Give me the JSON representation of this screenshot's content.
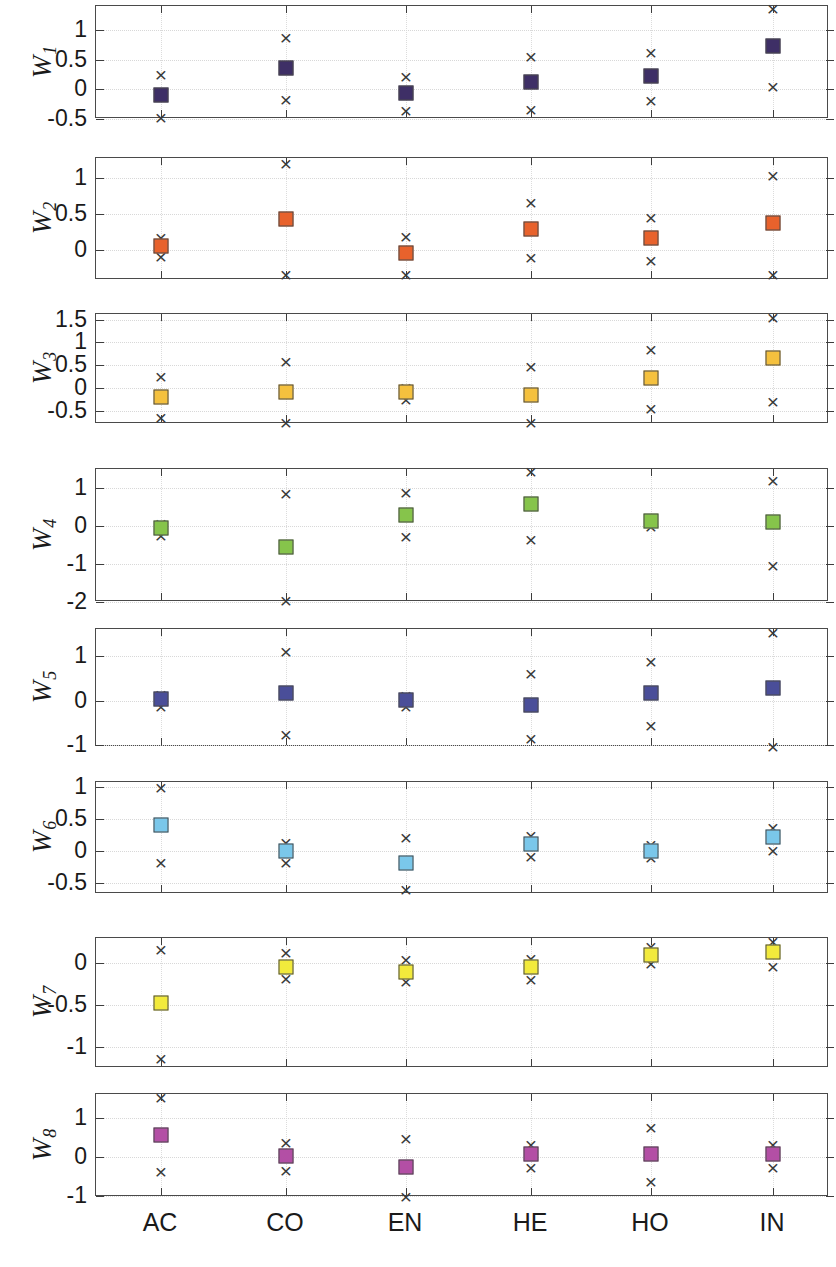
{
  "figure": {
    "kind": "multi-panel-scatter-with-range-markers",
    "panel_count": 8,
    "categories": [
      "AC",
      "CO",
      "EN",
      "HE",
      "HO",
      "IN"
    ]
  },
  "chart_data": {
    "type": "scatter",
    "title": "",
    "xlabel": "",
    "ylabel": "",
    "grid": true,
    "legend": "none",
    "categories": [
      "AC",
      "CO",
      "EN",
      "HE",
      "HO",
      "IN"
    ],
    "panels": [
      {
        "id": "w1",
        "label": "W",
        "subscript": "1",
        "ylabel": "W1",
        "color": "#3e2f66",
        "ylim": [
          -0.5,
          1.4
        ],
        "yticks": [
          -0.5,
          0,
          0.5,
          1
        ],
        "ytick_labels": [
          "-0.5",
          "0",
          "0.5",
          "1"
        ],
        "values": [
          -0.1,
          0.35,
          -0.06,
          0.13,
          0.22,
          0.72
        ],
        "upper": [
          0.26,
          0.88,
          0.22,
          0.56,
          0.62,
          1.37
        ],
        "lower": [
          -0.46,
          -0.17,
          -0.35,
          -0.34,
          -0.18,
          0.06
        ]
      },
      {
        "id": "w2",
        "label": "W",
        "subscript": "2",
        "ylabel": "W2",
        "color": "#e8622c",
        "ylim": [
          -0.42,
          1.28
        ],
        "yticks": [
          0,
          0.5,
          1
        ],
        "ytick_labels": [
          "0",
          "0.5",
          "1"
        ],
        "values": [
          0.06,
          0.43,
          -0.04,
          0.29,
          0.17,
          0.38
        ],
        "upper": [
          0.18,
          1.21,
          0.19,
          0.66,
          0.46,
          1.05
        ],
        "lower": [
          -0.08,
          -0.33,
          -0.33,
          -0.1,
          -0.14,
          -0.33
        ]
      },
      {
        "id": "w3",
        "label": "W",
        "subscript": "3",
        "ylabel": "W3",
        "color": "#f5c13e",
        "ylim": [
          -0.78,
          1.62
        ],
        "yticks": [
          -0.5,
          0,
          0.5,
          1,
          1.5
        ],
        "ytick_labels": [
          "-0.5",
          "0",
          "0.5",
          "1",
          "1.5"
        ],
        "values": [
          -0.19,
          -0.08,
          -0.08,
          -0.14,
          0.23,
          0.65
        ],
        "upper": [
          0.26,
          0.59,
          0.02,
          0.48,
          0.86,
          1.56
        ],
        "lower": [
          -0.62,
          -0.73,
          -0.23,
          -0.74,
          -0.44,
          -0.28
        ]
      },
      {
        "id": "w4",
        "label": "W",
        "subscript": "4",
        "ylabel": "W4",
        "color": "#86c44b",
        "ylim": [
          -2.0,
          1.5
        ],
        "yticks": [
          -2,
          -1,
          0,
          1
        ],
        "ytick_labels": [
          "-2",
          "-1",
          "0",
          "1"
        ],
        "values": [
          -0.05,
          -0.55,
          0.28,
          0.58,
          0.12,
          0.1
        ],
        "upper": [
          0.08,
          0.86,
          0.9,
          1.44,
          0.22,
          1.2
        ],
        "lower": [
          -0.24,
          -1.95,
          -0.27,
          -0.33,
          0.0,
          -1.03
        ]
      },
      {
        "id": "w5",
        "label": "W",
        "subscript": "5",
        "ylabel": "W5",
        "color": "#4a4e99",
        "ylim": [
          -1.05,
          1.62
        ],
        "yticks": [
          -1,
          0,
          1
        ],
        "ytick_labels": [
          "-1",
          "0",
          "1"
        ],
        "values": [
          0.03,
          0.18,
          0.02,
          -0.1,
          0.18,
          0.28
        ],
        "upper": [
          0.16,
          1.12,
          0.13,
          0.62,
          0.9,
          1.56
        ],
        "lower": [
          -0.12,
          -0.76,
          -0.12,
          -0.85,
          -0.56,
          -1.02
        ]
      },
      {
        "id": "w6",
        "label": "W",
        "subscript": "6",
        "ylabel": "W6",
        "color": "#7ac7ea",
        "ylim": [
          -0.68,
          1.08
        ],
        "yticks": [
          -0.5,
          0,
          0.5,
          1
        ],
        "ytick_labels": [
          "-0.5",
          "0",
          "0.5",
          "1"
        ],
        "values": [
          0.41,
          -0.01,
          -0.19,
          0.11,
          0.0,
          0.22
        ],
        "upper": [
          1.0,
          0.14,
          0.21,
          0.25,
          0.1,
          0.38
        ],
        "lower": [
          -0.17,
          -0.17,
          -0.6,
          -0.09,
          -0.1,
          0.01
        ]
      },
      {
        "id": "w7",
        "label": "W",
        "subscript": "7",
        "ylabel": "W7",
        "color": "#f2ea3c",
        "ylim": [
          -1.25,
          0.3
        ],
        "yticks": [
          -1,
          -0.5,
          0
        ],
        "ytick_labels": [
          "-1",
          "-0.5",
          "0"
        ],
        "values": [
          -0.47,
          -0.04,
          -0.1,
          -0.04,
          0.1,
          0.13
        ],
        "upper": [
          0.17,
          0.13,
          0.05,
          0.06,
          0.2,
          0.26
        ],
        "lower": [
          -1.13,
          -0.18,
          -0.21,
          -0.19,
          0.0,
          -0.03
        ]
      },
      {
        "id": "w8",
        "label": "W",
        "subscript": "8",
        "ylabel": "W8",
        "color": "#b34fa5",
        "ylim": [
          -1.02,
          1.62
        ],
        "yticks": [
          -1,
          0,
          1
        ],
        "ytick_labels": [
          "-1",
          "0",
          "1"
        ],
        "values": [
          0.58,
          0.03,
          -0.25,
          0.07,
          0.08,
          0.07
        ],
        "upper": [
          1.55,
          0.38,
          0.5,
          0.33,
          0.78,
          0.33
        ],
        "lower": [
          -0.35,
          -0.33,
          -1.0,
          -0.25,
          -0.62,
          -0.26
        ]
      }
    ]
  }
}
